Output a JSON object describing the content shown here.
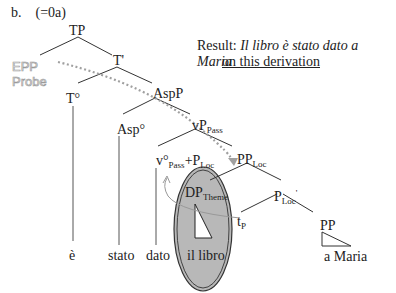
{
  "example": {
    "label": "b.",
    "ref": "(=0a)"
  },
  "probe": {
    "line1": "EPP",
    "line2": "Probe"
  },
  "result": {
    "prefix": "Result: ",
    "sentence": "Il libro è stato dato a Maria",
    "note": "on this derivation"
  },
  "nodes": {
    "tp": "TP",
    "tbar": "T'",
    "t0": "T°",
    "aspp": "AspP",
    "asp0": "Asp°",
    "vp_pass": {
      "base": "vP",
      "sub": "Pass"
    },
    "v0_pass_ploc": {
      "base": "v°",
      "sub1": "Pass",
      "plus": "+P",
      "sub2": "Loc"
    },
    "pp_loc": {
      "base": "PP",
      "sub": "Loc"
    },
    "dp_theme": {
      "base": "DP",
      "sub": "Theme"
    },
    "ploc_bar": {
      "base": "P",
      "sub": "Loc",
      "prime": "'"
    },
    "tp_trace": {
      "base": "t",
      "sub": "P"
    },
    "pp": "PP"
  },
  "leaves": {
    "e": "è",
    "stato": "stato",
    "dato": "dato",
    "il_libro": "il libro",
    "a_maria": "a Maria"
  },
  "colors": {
    "ellipse_fill": "#b8b8b8",
    "dotted_arrow": "#a0a0a0",
    "lines": "#333333"
  }
}
